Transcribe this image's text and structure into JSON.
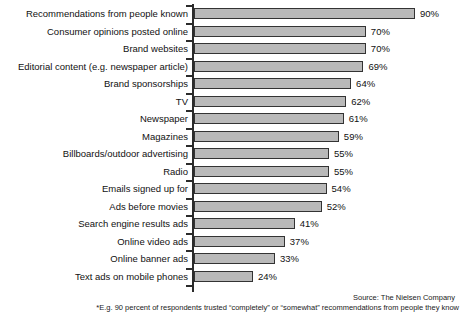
{
  "chart_data": {
    "type": "bar",
    "orientation": "horizontal",
    "title": "",
    "xlabel": "",
    "ylabel": "",
    "xlim": [
      0,
      100
    ],
    "grid": false,
    "legend": null,
    "value_suffix": "%",
    "categories": [
      "Recommendations from people known",
      "Consumer opinions posted online",
      "Brand websites",
      "Editorial content (e.g. newspaper article)",
      "Brand sponsorships",
      "TV",
      "Newspaper",
      "Magazines",
      "Billboards/outdoor advertising",
      "Radio",
      "Emails signed up for",
      "Ads before movies",
      "Search engine results ads",
      "Online video ads",
      "Online banner ads",
      "Text ads on mobile phones"
    ],
    "values": [
      90,
      70,
      70,
      69,
      64,
      62,
      61,
      59,
      55,
      55,
      54,
      52,
      41,
      37,
      33,
      24
    ],
    "value_labels": [
      "90%",
      "70%",
      "70%",
      "69%",
      "64%",
      "62%",
      "61%",
      "59%",
      "55%",
      "55%",
      "54%",
      "52%",
      "41%",
      "37%",
      "33%",
      "24%"
    ],
    "bar_color": "#b9b9b9",
    "bar_border_color": "#333333",
    "axis_color": "#2b2b2b"
  },
  "footer": {
    "source": "Source: The Nielsen Company",
    "footnote": "*E.g. 90 percent of respondents trusted “completely” or “somewhat” recommendations from people they know"
  }
}
